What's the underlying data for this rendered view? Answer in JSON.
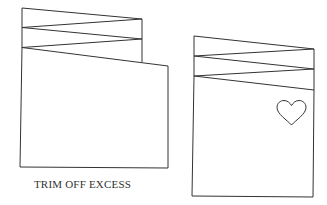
{
  "diagram": {
    "caption": "TRIM OFF EXCESS",
    "stroke_color": "#333333",
    "background": "#ffffff",
    "figures": [
      {
        "name": "folded-card-untrimmed",
        "description": "Accordion-folded card with zigzag pleats on top and an uneven bottom panel extending past the pleats"
      },
      {
        "name": "folded-card-trimmed",
        "description": "Trimmed accordion-folded card with zigzag pleats and a heart outline on the front panel",
        "decoration": "heart-outline"
      }
    ]
  }
}
